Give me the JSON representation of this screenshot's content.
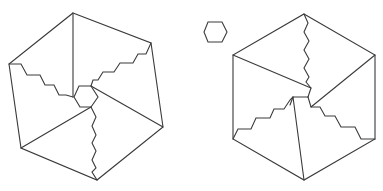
{
  "figure": {
    "panels": [
      {
        "name": "left-dissected-hexagon",
        "pieces": 6,
        "has_center_hexagon": true
      },
      {
        "name": "small-hexagon-piece"
      },
      {
        "name": "right-reassembled-hexagon",
        "pieces": 5,
        "has_center_hexagon": false
      }
    ],
    "stroke_color": "#3a3a3a",
    "background_color": "#ffffff"
  }
}
